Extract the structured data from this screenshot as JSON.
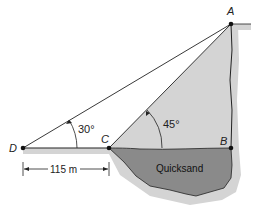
{
  "diagram": {
    "points": {
      "A": {
        "label": "A",
        "x": 231,
        "y": 24
      },
      "B": {
        "label": "B",
        "x": 231,
        "y": 148
      },
      "C": {
        "label": "C",
        "x": 109,
        "y": 148
      },
      "D": {
        "label": "D",
        "x": 23,
        "y": 148
      }
    },
    "angles": {
      "at_D": "30°",
      "at_C": "45°"
    },
    "region_label": "Quicksand",
    "dimension": "115 m",
    "colors": {
      "quicksand": "#8a8a8a",
      "ground_shadow": "#d4d4d4",
      "line": "#222222"
    }
  }
}
